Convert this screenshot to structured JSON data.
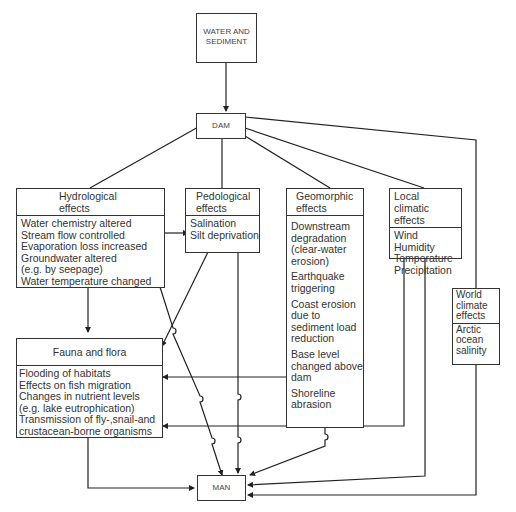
{
  "source": {
    "title": "WATER AND SEDIMENT"
  },
  "dam": {
    "label": "DAM"
  },
  "man": {
    "label": "MAN"
  },
  "hydrological": {
    "title_line1": "Hydrological",
    "title_line2": "effects",
    "items": [
      "Water chemistry altered",
      "Stream flow controlled",
      "Evaporation loss increased",
      "Groundwater altered",
      "(e.g. by seepage)",
      "Water temperature changed"
    ]
  },
  "pedological": {
    "title_line1": "Pedological",
    "title_line2": "effects",
    "items": [
      "Salination",
      "Silt deprivation"
    ]
  },
  "geomorphic": {
    "title_line1": "Geomorphic",
    "title_line2": "effects",
    "groups": [
      [
        "Downstream",
        "degradation",
        "(clear-water",
        "erosion)"
      ],
      [
        "Earthquake",
        "triggering"
      ],
      [
        "Coast erosion",
        "due to",
        "sediment load",
        "reduction"
      ],
      [
        "Base level",
        "changed above",
        "dam"
      ],
      [
        "Shoreline",
        "abrasion"
      ]
    ]
  },
  "local_climatic": {
    "title_line1": "Local climatic",
    "title_line2": "effects",
    "items": [
      "Wind",
      "Humidity",
      "Temperature",
      "Precipitation"
    ]
  },
  "world_climate": {
    "title_lines": [
      "World",
      "climate",
      "effects"
    ],
    "items": [
      "Arctic",
      "ocean",
      "salinity"
    ]
  },
  "fauna_flora": {
    "title": "Fauna and flora",
    "items": [
      "Flooding of habitats",
      "Effects on fish migration",
      "Changes in nutrient levels",
      "(e.g. lake eutrophication)",
      "Transmission of fly-,snail-and",
      "crustacean-borne organisms"
    ]
  }
}
